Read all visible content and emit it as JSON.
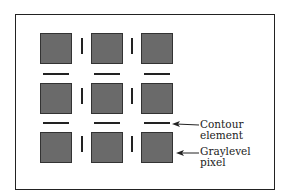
{
  "figure": {
    "grid": {
      "rows": 3,
      "cols": 3,
      "pixel_color": "#6a6a6a"
    },
    "labels": {
      "contour_line1": "Contour",
      "contour_line2": "element",
      "graylevel_line1": "Graylevel",
      "graylevel_line2": "pixel"
    }
  }
}
